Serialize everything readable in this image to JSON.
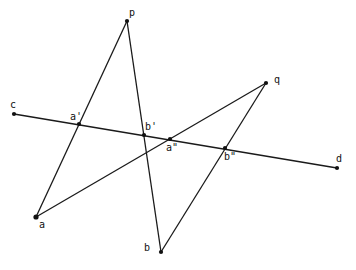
{
  "diagram": {
    "type": "projective-geometry-construction",
    "colors": {
      "line": "#1a1a1a",
      "point": "#111111",
      "background": "#ffffff"
    },
    "points": [
      {
        "id": "p",
        "label": "p",
        "x": 127,
        "y": 21,
        "lx": 129,
        "ly": 8
      },
      {
        "id": "q",
        "label": "q",
        "x": 266,
        "y": 83,
        "lx": 274,
        "ly": 75
      },
      {
        "id": "c",
        "label": "c",
        "x": 14,
        "y": 114,
        "lx": 10,
        "ly": 100
      },
      {
        "id": "d",
        "label": "d",
        "x": 337,
        "y": 168,
        "lx": 336,
        "ly": 154
      },
      {
        "id": "a",
        "label": "a",
        "x": 36,
        "y": 217,
        "lx": 39,
        "ly": 220
      },
      {
        "id": "b",
        "label": "b",
        "x": 161,
        "y": 252,
        "lx": 144,
        "ly": 243
      },
      {
        "id": "a1",
        "label": "a'",
        "x": 79,
        "y": 124,
        "lx": 70,
        "ly": 112
      },
      {
        "id": "b1",
        "label": "b'",
        "x": 144,
        "y": 135,
        "lx": 145,
        "ly": 122
      },
      {
        "id": "a2",
        "label": "a\"",
        "x": 170,
        "y": 139,
        "lx": 166,
        "ly": 143
      },
      {
        "id": "b2",
        "label": "b\"",
        "x": 225,
        "y": 148,
        "lx": 224,
        "ly": 152
      }
    ],
    "segments": [
      {
        "from": "c",
        "to": "d"
      },
      {
        "from": "p",
        "to": "a"
      },
      {
        "from": "p",
        "to": "b"
      },
      {
        "from": "q",
        "to": "a"
      },
      {
        "from": "q",
        "to": "b"
      }
    ]
  }
}
